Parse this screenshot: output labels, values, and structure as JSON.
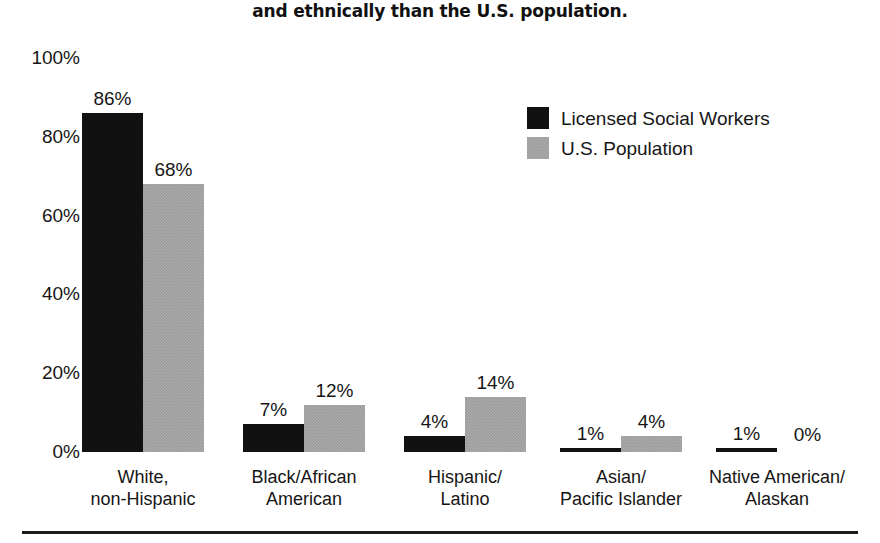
{
  "title": {
    "line1": "Licensed social workers are less diverse racially",
    "line2": "and ethnically than the U.S. population."
  },
  "legend": {
    "position": "top-right",
    "items": [
      {
        "label": "Licensed Social Workers",
        "swatch": "black",
        "color": "#111111"
      },
      {
        "label": "U.S. Population",
        "swatch": "gray",
        "color": "#9b9b9b"
      }
    ]
  },
  "axis": {
    "y_ticks": [
      "0%",
      "20%",
      "40%",
      "60%",
      "80%",
      "100%"
    ]
  },
  "chart_data": {
    "type": "bar",
    "title": "Licensed social workers are less diverse racially and ethnically than the U.S. population.",
    "xlabel": "",
    "ylabel": "",
    "ylim": [
      0,
      100
    ],
    "grid": false,
    "legend_position": "top-right",
    "categories": [
      "White,\nnon-Hispanic",
      "Black/African\nAmerican",
      "Hispanic/\nLatino",
      "Asian/\nPacific Islander",
      "Native American/\nAlaskan"
    ],
    "category_lines": [
      [
        "White,",
        "non-Hispanic"
      ],
      [
        "Black/African",
        "American"
      ],
      [
        "Hispanic/",
        "Latino"
      ],
      [
        "Asian/",
        "Pacific Islander"
      ],
      [
        "Native American/",
        "Alaskan"
      ]
    ],
    "series": [
      {
        "name": "Licensed Social Workers",
        "color": "#111111",
        "values": [
          86,
          7,
          4,
          1,
          1
        ],
        "labels": [
          "86%",
          "7%",
          "4%",
          "1%",
          "1%"
        ]
      },
      {
        "name": "U.S. Population",
        "color": "#9b9b9b",
        "values": [
          68,
          12,
          14,
          4,
          0
        ],
        "labels": [
          "68%",
          "12%",
          "14%",
          "4%",
          "0%"
        ]
      }
    ]
  }
}
